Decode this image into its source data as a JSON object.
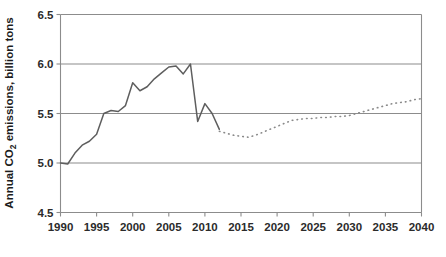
{
  "chart_data": {
    "type": "line",
    "title": "",
    "xlabel": "",
    "ylabel": "Annual CO2 emissions, billion tons",
    "ylabel_main": "Annual CO",
    "ylabel_sub": "2",
    "ylabel_rest": " emissions, billion tons",
    "xlim": [
      1990,
      2040
    ],
    "ylim": [
      4.5,
      6.5
    ],
    "ytick_labels": [
      "6.5",
      "6.0",
      "5.5",
      "5.0",
      "4.5"
    ],
    "ytick_values": [
      6.5,
      6.0,
      5.5,
      5.0,
      4.5
    ],
    "xtick_labels": [
      "1990",
      "1995",
      "2000",
      "2005",
      "2010",
      "2015",
      "2020",
      "2025",
      "2030",
      "2035",
      "2040"
    ],
    "xtick_values": [
      1990,
      1995,
      2000,
      2005,
      2010,
      2015,
      2020,
      2025,
      2030,
      2035,
      2040
    ],
    "grid": "horizontal",
    "legend": "none",
    "colors": {
      "historical_line": "#5e5e5e",
      "projection_line": "#8a8a8a",
      "axis": "#8c8c8c",
      "text": "#2b2b2b",
      "background": "#ffffff"
    },
    "series": [
      {
        "name": "Historical emissions",
        "style": "solid",
        "x": [
          1990,
          1991,
          1992,
          1993,
          1994,
          1995,
          1996,
          1997,
          1998,
          1999,
          2000,
          2001,
          2002,
          2003,
          2004,
          2005,
          2006,
          2007,
          2008,
          2009,
          2010,
          2011,
          2012
        ],
        "values": [
          5.0,
          4.99,
          5.1,
          5.18,
          5.22,
          5.29,
          5.5,
          5.53,
          5.52,
          5.58,
          5.81,
          5.73,
          5.77,
          5.85,
          5.91,
          5.97,
          5.98,
          5.9,
          6.0,
          5.42,
          5.6,
          5.5,
          5.34
        ]
      },
      {
        "name": "Projected emissions",
        "style": "dotted",
        "x": [
          2012,
          2013,
          2014,
          2015,
          2016,
          2017,
          2018,
          2019,
          2020,
          2021,
          2022,
          2023,
          2024,
          2025,
          2026,
          2027,
          2028,
          2029,
          2030,
          2031,
          2032,
          2033,
          2034,
          2035,
          2036,
          2037,
          2038,
          2039,
          2040
        ],
        "values": [
          5.32,
          5.3,
          5.28,
          5.27,
          5.26,
          5.28,
          5.31,
          5.34,
          5.37,
          5.4,
          5.43,
          5.44,
          5.45,
          5.45,
          5.46,
          5.46,
          5.47,
          5.47,
          5.48,
          5.5,
          5.52,
          5.54,
          5.56,
          5.58,
          5.6,
          5.61,
          5.62,
          5.64,
          5.65
        ]
      }
    ]
  }
}
